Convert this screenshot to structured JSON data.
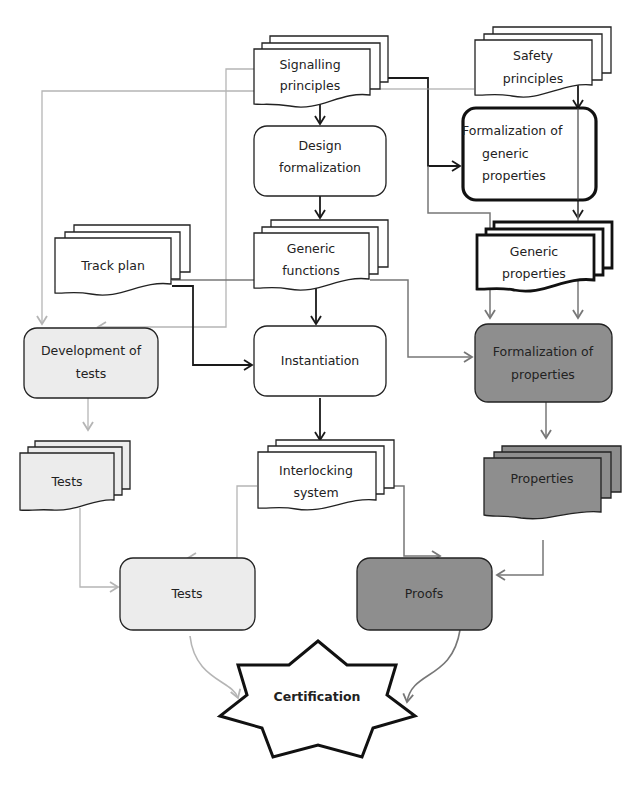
{
  "diagram": {
    "colors": {
      "white": "#ffffff",
      "light": "#ececec",
      "dark": "#8e8e8e",
      "stroke": "#222222",
      "arrow_dark": "#1a1a1a",
      "arrow_mid": "#777777",
      "arrow_light": "#b5b5b5"
    },
    "nodes": {
      "signalling_principles": {
        "line1": "Signalling",
        "line2": "principles"
      },
      "safety_principles": {
        "line1": "Safety",
        "line2": "principles"
      },
      "design_formalization": {
        "line1": "Design",
        "line2": "formalization"
      },
      "formalization_generic_properties": {
        "line1": "Formalization  of",
        "line2": "generic",
        "line3": "properties"
      },
      "track_plan": {
        "line1": "Track plan"
      },
      "generic_functions": {
        "line1": "Generic",
        "line2": "functions"
      },
      "generic_properties": {
        "line1": "Generic",
        "line2": "properties"
      },
      "development_of_tests": {
        "line1": "Development of",
        "line2": "tests"
      },
      "instantiation": {
        "line1": "Instantiation"
      },
      "formalization_of_properties": {
        "line1": "Formalization of",
        "line2": "properties"
      },
      "tests_doc": {
        "line1": "Tests"
      },
      "interlocking_system": {
        "line1": "Interlocking",
        "line2": "system"
      },
      "properties_doc": {
        "line1": "Properties"
      },
      "tests_process": {
        "line1": "Tests"
      },
      "proofs": {
        "line1": "Proofs"
      },
      "certification": {
        "line1": "Certification"
      }
    }
  }
}
